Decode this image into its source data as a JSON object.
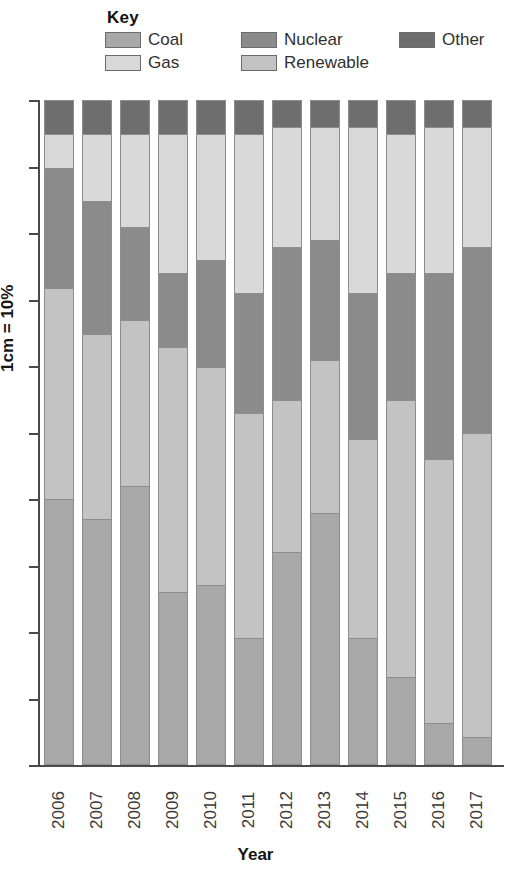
{
  "legend": {
    "title": "Key",
    "items": [
      {
        "label": "Coal",
        "key": "coal",
        "color": "#a8a8a8"
      },
      {
        "label": "Nuclear",
        "key": "nuclear",
        "color": "#8b8b8b"
      },
      {
        "label": "Other",
        "key": "other",
        "color": "#6e6e6e"
      },
      {
        "label": "Gas",
        "key": "gas",
        "color": "#d9d9d9"
      },
      {
        "label": "Renewable",
        "key": "renewable",
        "color": "#c3c3c3"
      }
    ]
  },
  "axes": {
    "ylabel": "1cm = 10%",
    "xlabel": "Year",
    "ytick_count": 11,
    "ymin": 0,
    "ymax": 100
  },
  "chart_data": {
    "type": "bar",
    "subtype": "stacked-column",
    "title": "",
    "xlabel": "Year",
    "ylabel": "1cm = 10%",
    "ylim": [
      0,
      100
    ],
    "grid": false,
    "legend_position": "top",
    "stack_order_top_to_bottom": [
      "Other",
      "Gas",
      "Nuclear",
      "Renewable",
      "Coal"
    ],
    "categories": [
      "2006",
      "2007",
      "2008",
      "2009",
      "2010",
      "2011",
      "2012",
      "2013",
      "2014",
      "2015",
      "2016",
      "2017"
    ],
    "series": [
      {
        "name": "Coal",
        "color": "#a8a8a8",
        "values": [
          40,
          37,
          42,
          26,
          27,
          19,
          32,
          38,
          19,
          13,
          6,
          4
        ]
      },
      {
        "name": "Renewable",
        "color": "#c3c3c3",
        "values": [
          32,
          28,
          25,
          37,
          33,
          34,
          23,
          23,
          30,
          42,
          40,
          46
        ]
      },
      {
        "name": "Nuclear",
        "color": "#8b8b8b",
        "values": [
          18,
          20,
          14,
          11,
          16,
          18,
          23,
          18,
          22,
          19,
          28,
          28
        ]
      },
      {
        "name": "Gas",
        "color": "#d9d9d9",
        "values": [
          5,
          10,
          14,
          21,
          19,
          24,
          18,
          17,
          25,
          21,
          22,
          18
        ]
      },
      {
        "name": "Other",
        "color": "#6e6e6e",
        "values": [
          5,
          5,
          5,
          5,
          5,
          5,
          4,
          4,
          4,
          5,
          4,
          4
        ]
      }
    ]
  }
}
